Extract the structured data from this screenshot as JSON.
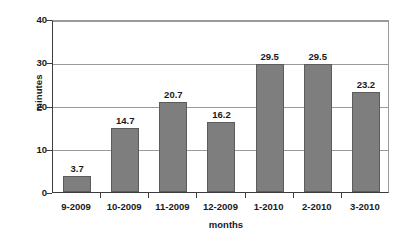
{
  "chart_data": {
    "type": "bar",
    "title": "",
    "subtitle": "",
    "xlabel": "months",
    "ylabel": "minutes",
    "categories": [
      "9-2009",
      "10-2009",
      "11-2009",
      "12-2009",
      "1-2010",
      "2-2010",
      "3-2010"
    ],
    "values": [
      3.7,
      14.7,
      20.7,
      16.2,
      29.5,
      29.5,
      23.2
    ],
    "data_labels": [
      "3.7",
      "14.7",
      "20.7",
      "16.2",
      "29.5",
      "29.5",
      "23.2"
    ],
    "ylim": [
      0,
      40
    ],
    "ytick_values": [
      0,
      10,
      20,
      30,
      40
    ],
    "ytick_labels": [
      "0",
      "10",
      "20",
      "30",
      "40"
    ],
    "grid": true,
    "grid_axis": "y",
    "legend": false,
    "legend_position": "none",
    "annotations": [],
    "colors": {
      "bar_fill": "#7e7e7e",
      "bar_border": "#5c5c5c",
      "gridline": "#9a9a9a",
      "axis": "#3d3d3d",
      "plot_background": "#ffffff",
      "text": "#1a1a1a"
    }
  }
}
